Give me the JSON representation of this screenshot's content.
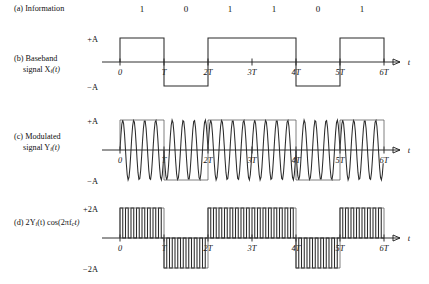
{
  "figure": {
    "background": "#ffffff",
    "ink": "#1a1a1a",
    "wave_color": "#2b2b2b",
    "envelope_color": "#555555"
  },
  "geometry": {
    "origin_x": 120,
    "axis_end_x": 400,
    "bit_width": 44,
    "n_bits": 6,
    "carrier_cycles_per_bit": 4,
    "doubled_cycles_per_bit": 8
  },
  "rows": [
    {
      "id": "information",
      "tag": "(a)",
      "label_line1": "(a) Information",
      "label_line2": ""
    },
    {
      "id": "baseband",
      "tag": "(b)",
      "label_line1": "(b) Baseband",
      "label_line2": "signal X",
      "label_sub": "i",
      "label_line2_tail": "(t)",
      "amp_top": "+A",
      "amp_bottom": "−A",
      "axis_label": "t"
    },
    {
      "id": "modulated",
      "tag": "(c)",
      "label_line1": "(c) Modulated",
      "label_line2": "signal Y",
      "label_sub": "i",
      "label_line2_tail": "(t)",
      "amp_top": "+A",
      "amp_bottom": "−A",
      "axis_label": "t"
    },
    {
      "id": "product",
      "tag": "(d)",
      "label_line1": "(d) 2Y",
      "label_sub": "i",
      "label_line1_tail": "(t) cos(2πf",
      "label_sub2": "c",
      "label_line1_tail2": "t)",
      "label_line2": "",
      "amp_top": "+2A",
      "amp_bottom": "−2A",
      "axis_label": "t"
    }
  ],
  "chart_data": {
    "type": "line",
    "xlabel": "t",
    "ylabel": "",
    "bits": [
      1,
      0,
      1,
      1,
      0,
      1
    ],
    "bit_labels": [
      "1",
      "0",
      "1",
      "1",
      "0",
      "1"
    ],
    "time_ticks": [
      "0",
      "T",
      "2T",
      "3T",
      "4T",
      "5T",
      "6T"
    ],
    "time_tick_values": [
      0,
      1,
      2,
      3,
      4,
      5,
      6
    ],
    "xlim": [
      0,
      6
    ],
    "series": [
      {
        "name": "Baseband signal X_i(t)",
        "type": "square",
        "levels": [
          1,
          -1,
          1,
          1,
          -1,
          1
        ],
        "amplitude_labels": [
          "+A",
          "−A"
        ],
        "ylim": [
          -1,
          1
        ]
      },
      {
        "name": "Modulated signal Y_i(t)",
        "type": "bpsk-carrier",
        "phase": [
          0,
          180,
          0,
          0,
          180,
          0
        ],
        "cycles_per_bit": 4,
        "amplitude_labels": [
          "+A",
          "−A"
        ],
        "ylim": [
          -1,
          1
        ]
      },
      {
        "name": "2Y_i(t) cos(2πf_c t)",
        "type": "rectified-doubled",
        "offset_sign": [
          1,
          -1,
          1,
          1,
          -1,
          1
        ],
        "cycles_per_bit": 8,
        "amplitude_labels": [
          "+2A",
          "−2A"
        ],
        "ylim": [
          -1,
          1
        ]
      }
    ]
  }
}
